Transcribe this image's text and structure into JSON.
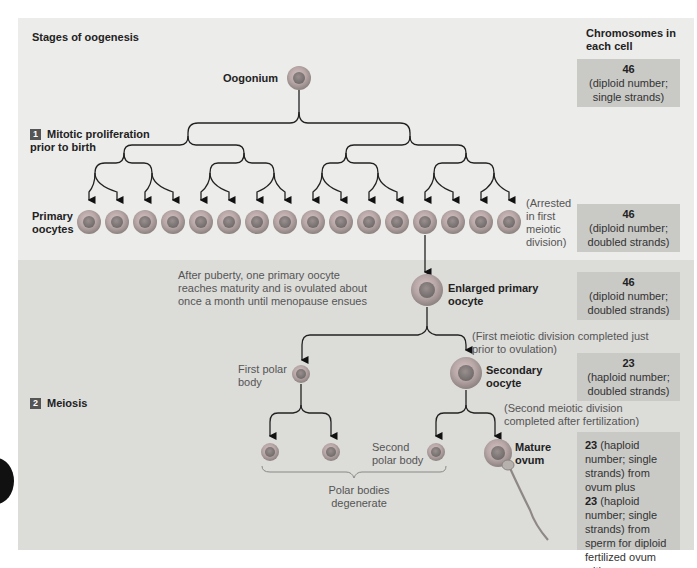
{
  "title": "Stages of oogenesis",
  "chromosome_header": "Chromosomes in each cell",
  "stages": [
    {
      "number": "1",
      "label": "Mitotic proliferation prior to birth"
    },
    {
      "number": "2",
      "label": "Meiosis"
    }
  ],
  "cells": {
    "oogonium": "Oogonium",
    "primary_oocytes": "Primary oocytes",
    "arrested_note": "(Arrested in first meiotic division)",
    "enlarged_primary": "Enlarged primary oocyte",
    "puberty_note": "After puberty, one primary oocyte reaches maturity and is ovulated about once a month until menopause ensues",
    "first_meiotic_note": "(First meiotic division completed just prior to ovulation)",
    "first_polar_body": "First polar body",
    "secondary_oocyte": "Secondary oocyte",
    "second_meiotic_note": "(Second meiotic division completed after fertilization)",
    "second_polar_body": "Second polar body",
    "mature_ovum": "Mature ovum",
    "polar_bodies_note": "Polar bodies degenerate",
    "primary_oocyte_count": 16
  },
  "chromosome_boxes": [
    {
      "number": "46",
      "desc": "(diploid number; single strands)"
    },
    {
      "number": "46",
      "desc": "(diploid number; doubled strands)"
    },
    {
      "number": "46",
      "desc": "(diploid number; doubled strands)"
    },
    {
      "number": "23",
      "desc": "(haploid number; doubled strands)"
    },
    {
      "n1": "23",
      "d1": " (haploid number; single strands) from ovum plus",
      "n2": "23",
      "d2": " (haploid number; single strands) from sperm for diploid fertilized ovum with",
      "n3": "46",
      "d3": " chromosomes"
    }
  ],
  "colors": {
    "cell_outer": "#b8b8b4",
    "cell_inner": "#8a8a85",
    "panel_top": "#ececea",
    "panel_bottom": "#dcdcd9",
    "chrom_box": "#c9c9c6"
  }
}
